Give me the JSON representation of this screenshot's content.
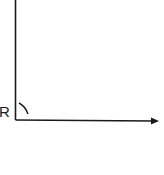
{
  "diagram": {
    "type": "right-angle-axes",
    "vertex_label": "R",
    "elements": [
      {
        "kind": "vertical-ray",
        "from": [
          15.5,
          120
        ],
        "to": [
          15.5,
          0
        ]
      },
      {
        "kind": "horizontal-ray",
        "from": [
          15.5,
          120
        ],
        "to": [
          158,
          121
        ],
        "arrowhead": true
      },
      {
        "kind": "angle-arc",
        "at_vertex": "R"
      }
    ],
    "colors": {
      "stroke": "#1a1a1a",
      "background": "#ffffff"
    }
  }
}
